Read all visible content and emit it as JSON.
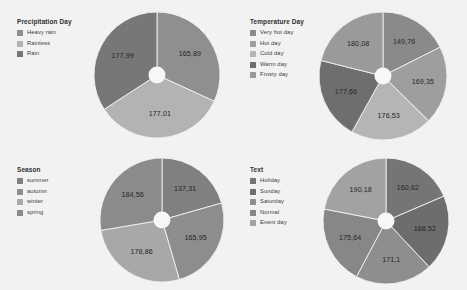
{
  "background": {
    "page": "#ffffff",
    "panel": "#f2f2f2",
    "hole": "#f7f7f7",
    "slice_divider": "#f2f2f2",
    "label_text": "#262626",
    "title_text": "#2e2e2e"
  },
  "chart_data": [
    {
      "type": "pie",
      "title": "Precipitation Day",
      "position": "top-left",
      "legend_position": "left",
      "donut": true,
      "categories": [
        "Heavy rain",
        "Rainless",
        "Rain"
      ],
      "values": [
        165.89,
        177.01,
        177.99
      ],
      "labels": [
        "165,89",
        "177,01",
        "177,99"
      ],
      "colors": [
        "#8f8f8f",
        "#b3b3b3",
        "#777777"
      ],
      "total": 520.89,
      "xlabel": "",
      "ylabel": ""
    },
    {
      "type": "pie",
      "title": "Temperature Day",
      "position": "top-right",
      "legend_position": "left",
      "donut": true,
      "categories": [
        "Very hot day",
        "Hot day",
        "Cold day",
        "Warm day",
        "Frosty day"
      ],
      "values": [
        149.76,
        169.35,
        176.53,
        177.66,
        180.08
      ],
      "labels": [
        "149,76",
        "169,35",
        "176,53",
        "177,66",
        "180,08"
      ],
      "colors": [
        "#8a8a8a",
        "#9e9e9e",
        "#b5b5b5",
        "#6e6e6e",
        "#9a9a9a"
      ],
      "total": 853.38,
      "xlabel": "",
      "ylabel": ""
    },
    {
      "type": "pie",
      "title": "Season",
      "position": "bottom-left",
      "legend_position": "left",
      "donut": true,
      "categories": [
        "summer",
        "autumn",
        "winter",
        "spring"
      ],
      "values": [
        137.31,
        165.95,
        178.86,
        184.56
      ],
      "labels": [
        "137,31",
        "165,95",
        "178,86",
        "184,56"
      ],
      "colors": [
        "#808080",
        "#8d8d8d",
        "#a8a8a8",
        "#8b8b8b"
      ],
      "total": 666.68,
      "xlabel": "",
      "ylabel": ""
    },
    {
      "type": "pie",
      "title": "Text",
      "position": "bottom-right",
      "legend_position": "left",
      "donut": true,
      "categories": [
        "Holiday",
        "Sunday",
        "Saturday",
        "Normal",
        "Event day"
      ],
      "values": [
        160.62,
        168.52,
        171.1,
        175.64,
        190.18
      ],
      "labels": [
        "160,62",
        "168,52",
        "171,1",
        "175,64",
        "190,18"
      ],
      "colors": [
        "#757575",
        "#6d6d6d",
        "#8e8e8e",
        "#878787",
        "#a2a2a2"
      ],
      "total": 866.06,
      "xlabel": "",
      "ylabel": ""
    }
  ]
}
